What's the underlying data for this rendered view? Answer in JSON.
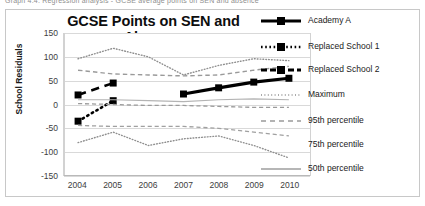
{
  "top_caption": {
    "left": "Graph 4.4: Regression analysis - GCSE average points on SEN and absence",
    "right": ""
  },
  "chart_data": {
    "type": "line",
    "title": "GCSE Points on SEN and Absence",
    "xlabel": "",
    "ylabel": "School Residuals",
    "x": [
      2004,
      2005,
      2006,
      2007,
      2008,
      2009,
      2010
    ],
    "xlim": [
      2003.6,
      2010.6
    ],
    "ylim": [
      -150,
      150
    ],
    "yticks": [
      150,
      100,
      50,
      0,
      -50,
      -100,
      -150
    ],
    "ytick_labels": [
      "150",
      "100",
      "50",
      "0",
      "-50",
      "-100",
      "-150"
    ],
    "xtick_labels": [
      "2004",
      "2005",
      "2006",
      "2007",
      "2008",
      "2009",
      "2010"
    ],
    "grid": true,
    "legend_position": "right",
    "series": [
      {
        "name": "Academy A",
        "style": "solid-marker",
        "color": "#000000",
        "width": 3.2,
        "marker": "square",
        "x": [
          2007,
          2008,
          2009,
          2010
        ],
        "values": [
          22,
          35,
          47,
          55
        ]
      },
      {
        "name": "Replaced School 1",
        "style": "dotted-marker",
        "color": "#000000",
        "width": 2.6,
        "marker": "square",
        "x": [
          2004,
          2005
        ],
        "values": [
          -35,
          8
        ]
      },
      {
        "name": "Replaced School 2",
        "style": "dashed-marker",
        "color": "#000000",
        "width": 2.6,
        "marker": "square",
        "x": [
          2004,
          2005
        ],
        "values": [
          20,
          45
        ]
      },
      {
        "name": "Maximum",
        "style": "dotted",
        "color": "#8f8f8f",
        "width": 1.4,
        "x": [
          2004,
          2005,
          2006,
          2007,
          2008,
          2009,
          2010
        ],
        "values": [
          96,
          118,
          100,
          62,
          82,
          96,
          92
        ]
      },
      {
        "name": "95th percentile",
        "style": "dashed",
        "color": "#9a9a9a",
        "width": 1.4,
        "x": [
          2004,
          2005,
          2006,
          2007,
          2008,
          2009,
          2010
        ],
        "values": [
          72,
          64,
          62,
          60,
          62,
          72,
          80
        ]
      },
      {
        "name": "75th percentile",
        "style": "solid",
        "color": "#b4b4b4",
        "width": 1.2,
        "x": [
          2004,
          2005,
          2006,
          2007,
          2008,
          2009,
          2010
        ],
        "values": [
          10,
          10,
          8,
          6,
          10,
          12,
          10
        ]
      },
      {
        "name": "50th percentile",
        "style": "dashed",
        "color": "#9a9a9a",
        "width": 1.3,
        "x": [
          2004,
          2005,
          2006,
          2007,
          2008,
          2009,
          2010
        ],
        "values": [
          2,
          0,
          -2,
          -2,
          -4,
          -6,
          -6
        ]
      },
      {
        "name": "lower-band-a",
        "style": "dashed",
        "color": "#a0a0a0",
        "width": 1.3,
        "x": [
          2004,
          2005,
          2006,
          2007,
          2008,
          2009,
          2010
        ],
        "values": [
          -44,
          -46,
          -46,
          -46,
          -50,
          -58,
          -66
        ]
      },
      {
        "name": "lower-band-b",
        "style": "dotted",
        "color": "#8f8f8f",
        "width": 1.4,
        "x": [
          2004,
          2005,
          2006,
          2007,
          2008,
          2009,
          2010
        ],
        "values": [
          -80,
          -58,
          -86,
          -72,
          -66,
          -86,
          -112
        ]
      }
    ],
    "legend_entries": [
      {
        "label": "Academy A",
        "style": "solid-marker"
      },
      {
        "label": "Replaced School 1",
        "style": "dotted-marker"
      },
      {
        "label": "Replaced School 2",
        "style": "dashed-marker"
      },
      {
        "label": "Maximum",
        "style": "dotted"
      },
      {
        "label": "95th percentile",
        "style": "dashed"
      },
      {
        "label": "75th percentile",
        "style": "faint"
      },
      {
        "label": "50th percentile",
        "style": "solid-gray"
      }
    ]
  }
}
